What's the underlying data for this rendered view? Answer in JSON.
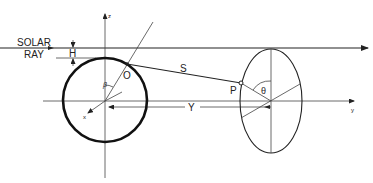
{
  "diagram": {
    "labels": {
      "solar_line1": "SOLAR",
      "solar_line2": "RAY",
      "h": "H",
      "o": "O",
      "s": "S",
      "p": "P",
      "y_dim": "Y",
      "theta": "θ",
      "beta": "β",
      "z_axis": "z",
      "y_axis": "y",
      "x_axis": "x"
    },
    "colors": {
      "line": "#222222",
      "background": "#ffffff"
    }
  }
}
